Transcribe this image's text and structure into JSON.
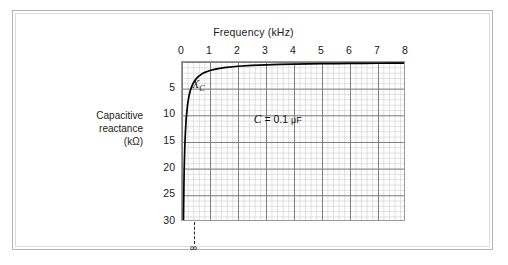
{
  "figure": {
    "frame_color": "#b4b4b4",
    "background": "#ffffff"
  },
  "chart_data": {
    "type": "line",
    "title": "Frequency (kHz)",
    "xlabel": "Frequency (kHz)",
    "ylabel": "Capacitive reactance (kΩ)",
    "ylabel_lines": [
      "Capacitive",
      "reactance",
      "(kΩ)"
    ],
    "xlim": [
      0,
      8
    ],
    "ylim": [
      0,
      30
    ],
    "y_inverted": true,
    "grid": true,
    "grid_minor": true,
    "legend": "none",
    "xticks": [
      0,
      1,
      2,
      3,
      4,
      5,
      6,
      7,
      8
    ],
    "xtick_labels": [
      "0",
      "1",
      "2",
      "3",
      "4",
      "5",
      "6",
      "7",
      "8"
    ],
    "yticks": [
      5,
      10,
      15,
      20,
      25,
      30
    ],
    "ytick_labels": [
      "5",
      "10",
      "15",
      "20",
      "25",
      "30"
    ],
    "series": [
      {
        "name": "X_C",
        "equation": "Xc = 1 / (2*pi*f*C)",
        "x": [
          0.053,
          0.06,
          0.07,
          0.08,
          0.09,
          0.1,
          0.12,
          0.15,
          0.2,
          0.25,
          0.3,
          0.35,
          0.4,
          0.5,
          0.6,
          0.7,
          0.8,
          0.9,
          1.0,
          1.2,
          1.5,
          2.0,
          2.5,
          3.0,
          3.5,
          4.0,
          4.5,
          5.0,
          5.5,
          6.0,
          6.5,
          7.0,
          7.5,
          8.0
        ],
        "y": [
          30.0,
          26.5,
          22.7,
          19.9,
          17.7,
          15.9,
          13.3,
          10.6,
          7.96,
          6.37,
          5.31,
          4.55,
          3.98,
          3.18,
          2.65,
          2.27,
          1.99,
          1.77,
          1.59,
          1.33,
          1.06,
          0.8,
          0.64,
          0.53,
          0.45,
          0.4,
          0.35,
          0.32,
          0.29,
          0.27,
          0.24,
          0.23,
          0.21,
          0.2
        ]
      }
    ],
    "annotations": [
      {
        "name": "curve-label",
        "text": "X",
        "subscript": "C",
        "x": 0.4,
        "y": 4.5
      },
      {
        "name": "capacitance-value",
        "symbol": "C",
        "text": " = 0.1 ",
        "unit": "μF",
        "x": 2.6,
        "y": 11.0
      },
      {
        "name": "infinity-marker",
        "text": "∞",
        "x": 0.45,
        "y": 30.0
      }
    ]
  }
}
